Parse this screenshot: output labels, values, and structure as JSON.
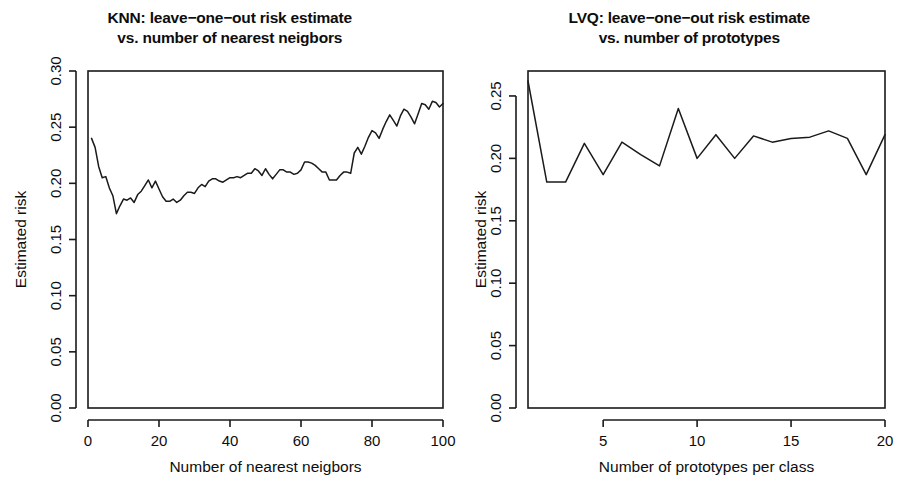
{
  "figure": {
    "background": "#ffffff",
    "line_color": "#1a1a1a",
    "axis_color": "#1a1a1a"
  },
  "panels": [
    {
      "id": "knn-panel",
      "title_line1": "KNN: leave−one−out risk estimate",
      "title_line2": "vs. number of nearest neigbors",
      "xlabel": "Number of nearest neigbors",
      "ylabel": "Estimated risk",
      "xticks": [
        "0",
        "20",
        "40",
        "60",
        "80",
        "100"
      ],
      "yticks": [
        "0.00",
        "0.05",
        "0.10",
        "0.15",
        "0.20",
        "0.25",
        "0.30"
      ]
    },
    {
      "id": "lvq-panel",
      "title_line1": "LVQ: leave−one−out risk estimate",
      "title_line2": "vs. number of prototypes",
      "xlabel": "Number of prototypes per class",
      "ylabel": "Estimated risk",
      "xticks": [
        "5",
        "10",
        "15",
        "20"
      ],
      "yticks": [
        "0.00",
        "0.05",
        "0.10",
        "0.15",
        "0.20",
        "0.25"
      ]
    }
  ],
  "chart_data": [
    {
      "type": "line",
      "id": "knn",
      "title": "KNN: leave-one-out risk estimate vs. number of nearest neigbors",
      "xlabel": "Number of nearest neigbors",
      "ylabel": "Estimated risk",
      "xlim": [
        0,
        100
      ],
      "ylim": [
        0.0,
        0.3
      ],
      "xticks": [
        0,
        20,
        40,
        60,
        80,
        100
      ],
      "yticks": [
        0.0,
        0.05,
        0.1,
        0.15,
        0.2,
        0.25,
        0.3
      ],
      "grid": false,
      "legend": "none",
      "x": [
        1,
        2,
        3,
        4,
        5,
        6,
        7,
        8,
        9,
        10,
        11,
        12,
        13,
        14,
        15,
        16,
        17,
        18,
        19,
        20,
        21,
        22,
        23,
        24,
        25,
        26,
        27,
        28,
        29,
        30,
        31,
        32,
        33,
        34,
        35,
        36,
        37,
        38,
        39,
        40,
        41,
        42,
        43,
        44,
        45,
        46,
        47,
        48,
        49,
        50,
        51,
        52,
        53,
        54,
        55,
        56,
        57,
        58,
        59,
        60,
        61,
        62,
        63,
        64,
        65,
        66,
        67,
        68,
        69,
        70,
        71,
        72,
        73,
        74,
        75,
        76,
        77,
        78,
        79,
        80,
        81,
        82,
        83,
        84,
        85,
        86,
        87,
        88,
        89,
        90,
        91,
        92,
        93,
        94,
        95,
        96,
        97,
        98,
        99,
        100
      ],
      "y": [
        0.24,
        0.232,
        0.215,
        0.205,
        0.206,
        0.196,
        0.189,
        0.173,
        0.18,
        0.186,
        0.185,
        0.187,
        0.183,
        0.19,
        0.193,
        0.198,
        0.203,
        0.196,
        0.202,
        0.195,
        0.188,
        0.184,
        0.184,
        0.186,
        0.183,
        0.185,
        0.189,
        0.192,
        0.192,
        0.191,
        0.196,
        0.199,
        0.197,
        0.202,
        0.204,
        0.204,
        0.202,
        0.201,
        0.203,
        0.205,
        0.205,
        0.206,
        0.205,
        0.207,
        0.209,
        0.209,
        0.213,
        0.211,
        0.207,
        0.213,
        0.208,
        0.204,
        0.208,
        0.212,
        0.212,
        0.21,
        0.21,
        0.208,
        0.209,
        0.212,
        0.219,
        0.219,
        0.218,
        0.216,
        0.213,
        0.21,
        0.21,
        0.203,
        0.203,
        0.203,
        0.207,
        0.21,
        0.21,
        0.209,
        0.227,
        0.232,
        0.226,
        0.233,
        0.241,
        0.247,
        0.245,
        0.24,
        0.248,
        0.255,
        0.261,
        0.256,
        0.251,
        0.26,
        0.266,
        0.264,
        0.259,
        0.253,
        0.262,
        0.271,
        0.27,
        0.266,
        0.273,
        0.272,
        0.268,
        0.271
      ]
    },
    {
      "type": "line",
      "id": "lvq",
      "title": "LVQ: leave-one-out risk estimate vs. number of prototypes",
      "xlabel": "Number of prototypes per class",
      "ylabel": "Estimated risk",
      "xlim": [
        1,
        20
      ],
      "ylim": [
        0.0,
        0.27
      ],
      "xticks": [
        5,
        10,
        15,
        20
      ],
      "yticks": [
        0.0,
        0.05,
        0.1,
        0.15,
        0.2,
        0.25
      ],
      "grid": false,
      "legend": "none",
      "x": [
        1,
        2,
        3,
        4,
        5,
        6,
        7,
        8,
        9,
        10,
        11,
        12,
        13,
        14,
        15,
        16,
        17,
        18,
        19,
        20
      ],
      "y": [
        0.262,
        0.181,
        0.181,
        0.212,
        0.187,
        0.213,
        0.203,
        0.194,
        0.24,
        0.2,
        0.219,
        0.2,
        0.218,
        0.213,
        0.216,
        0.217,
        0.222,
        0.216,
        0.187,
        0.219
      ]
    }
  ]
}
